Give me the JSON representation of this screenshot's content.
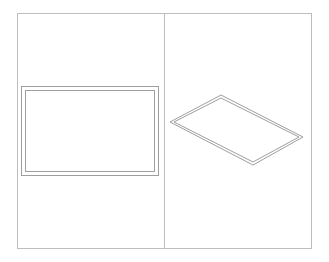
{
  "diagram": {
    "colors": {
      "frame": "#bdbdbd",
      "shape": "#9e9e9e",
      "background": "#ffffff"
    },
    "frame": {
      "x": 17,
      "y": 13,
      "width": 294,
      "height": 235
    },
    "divider_x": 164,
    "panels": [
      {
        "name": "front-view",
        "outer_rect": {
          "x": 21,
          "y": 86,
          "width": 137,
          "height": 89
        },
        "inner_rect": {
          "x": 25,
          "y": 90,
          "width": 129,
          "height": 81
        }
      },
      {
        "name": "isometric-view",
        "outer_points": "170,122 221,95 303,137 253,165",
        "inner_points": "174,122 221,98 299,137 253,162"
      }
    ]
  }
}
